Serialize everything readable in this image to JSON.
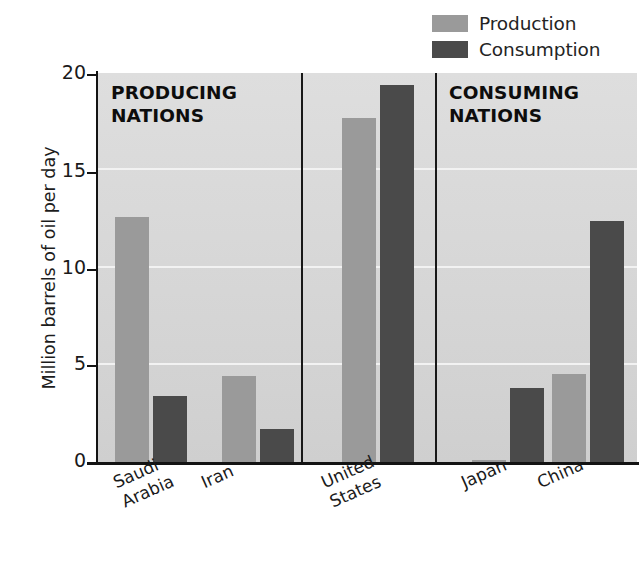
{
  "legend": {
    "items": [
      {
        "label": "Production",
        "color": "#9a9a9a",
        "swatch_name": "production-swatch"
      },
      {
        "label": "Consumption",
        "color": "#4a4a4a",
        "swatch_name": "consumption-swatch"
      }
    ]
  },
  "axes": {
    "y_title": "Million barrels of oil per day",
    "y_ticks": [
      "0",
      "5",
      "10",
      "15",
      "20"
    ]
  },
  "sections": [
    {
      "id": "producing",
      "line1": "PRODUCING",
      "line2": "NATIONS"
    },
    {
      "id": "consuming",
      "line1": "CONSUMING",
      "line2": "NATIONS"
    }
  ],
  "categories_display": [
    {
      "name": "saudi-arabia",
      "text": "Saudi\nArabia"
    },
    {
      "name": "iran",
      "text": "Iran"
    },
    {
      "name": "united-states",
      "text": "United\nStates"
    },
    {
      "name": "japan",
      "text": "Japan"
    },
    {
      "name": "china",
      "text": "China"
    }
  ],
  "chart_data": {
    "type": "bar",
    "title": "",
    "subtitle": "",
    "xlabel": "",
    "ylabel": "Million barrels of oil per day",
    "ylim": [
      0,
      20
    ],
    "yticks": [
      0,
      5,
      10,
      15,
      20
    ],
    "grid": true,
    "legend_position": "top-right",
    "categories": [
      "Saudi Arabia",
      "Iran",
      "United States",
      "Japan",
      "China"
    ],
    "series": [
      {
        "name": "Production",
        "color": "#9a9a9a",
        "values": [
          12.6,
          4.4,
          17.7,
          0.1,
          4.5
        ]
      },
      {
        "name": "Consumption",
        "color": "#4a4a4a",
        "values": [
          3.4,
          1.7,
          19.4,
          3.8,
          12.4
        ]
      }
    ],
    "annotations": [
      {
        "text": "PRODUCING NATIONS",
        "covers": [
          "Saudi Arabia",
          "Iran"
        ]
      },
      {
        "text": "CONSUMING NATIONS",
        "covers": [
          "Japan",
          "China"
        ]
      }
    ],
    "group_dividers": [
      "after Iran",
      "after United States"
    ]
  },
  "geometry": {
    "plot_left": 97,
    "plot_top": 73,
    "plot_width": 540,
    "plot_height": 389,
    "bar_width": 34,
    "bar_x": [
      18,
      56,
      125,
      163,
      245,
      283,
      375,
      413,
      455,
      493
    ],
    "divider_x": [
      204,
      338
    ],
    "heading_pos": [
      {
        "left": 14,
        "top": 8
      },
      {
        "left": 352,
        "top": 8
      }
    ],
    "cat_label_pos": [
      {
        "left": 110,
        "top": 474
      },
      {
        "left": 198,
        "top": 474
      },
      {
        "left": 318,
        "top": 474
      },
      {
        "left": 458,
        "top": 474
      },
      {
        "left": 534,
        "top": 474
      }
    ],
    "tick_y": [
      462,
      365,
      269,
      172,
      74
    ]
  }
}
